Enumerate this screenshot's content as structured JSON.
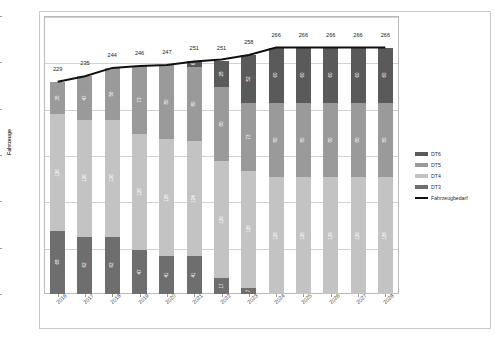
{
  "chart_data": {
    "type": "bar",
    "stacked": true,
    "title": "",
    "xlabel": "",
    "ylabel": "Fahrzeuge",
    "ylim": [
      0,
      300
    ],
    "ytick_values": [
      0,
      50,
      100,
      150,
      200,
      250,
      300
    ],
    "ytick_labels": [
      "0",
      "50",
      "100",
      "150",
      "200",
      "250",
      "300"
    ],
    "grid": true,
    "legend_position": "right",
    "categories": [
      "2016",
      "2017",
      "2018",
      "2019",
      "2020",
      "2021",
      "2022",
      "2023",
      "2024",
      "2025",
      "2026",
      "2027",
      "2028"
    ],
    "series": [
      {
        "name": "DT3",
        "color": "#6e6e6e",
        "values": [
          68,
          62,
          62,
          47,
          41,
          41,
          17,
          7,
          0,
          0,
          0,
          0,
          0
        ]
      },
      {
        "name": "DT4",
        "color": "#c3c3c3",
        "values": [
          126,
          126,
          126,
          126,
          126,
          124,
          126,
          126,
          126,
          126,
          126,
          126,
          126
        ]
      },
      {
        "name": "DT5",
        "color": "#9a9a9a",
        "values": [
          35,
          47,
          56,
          73,
          80,
          80,
          80,
          73,
          80,
          80,
          80,
          80,
          80
        ]
      },
      {
        "name": "DT6",
        "color": "#5a5a5a",
        "values": [
          0,
          0,
          0,
          0,
          0,
          6,
          28,
          52,
          60,
          60,
          60,
          60,
          60
        ]
      }
    ],
    "totals": [
      229,
      235,
      244,
      246,
      247,
      251,
      251,
      258,
      266,
      266,
      266,
      266,
      266
    ],
    "line_series": {
      "name": "Fahrzeugbedarf",
      "color": "#111111",
      "values": [
        229,
        235,
        244,
        246,
        247,
        251,
        253,
        258,
        266,
        266,
        266,
        266,
        266
      ]
    }
  },
  "legend": {
    "items": [
      {
        "label": "DT6",
        "color": "#5a5a5a",
        "kind": "swatch"
      },
      {
        "label": "DT5",
        "color": "#9a9a9a",
        "kind": "swatch"
      },
      {
        "label": "DT4",
        "color": "#c3c3c3",
        "kind": "swatch"
      },
      {
        "label": "DT3",
        "color": "#6e6e6e",
        "kind": "swatch"
      },
      {
        "label": "Fahrzeugbedarf",
        "color": "#111111",
        "kind": "line"
      }
    ]
  }
}
